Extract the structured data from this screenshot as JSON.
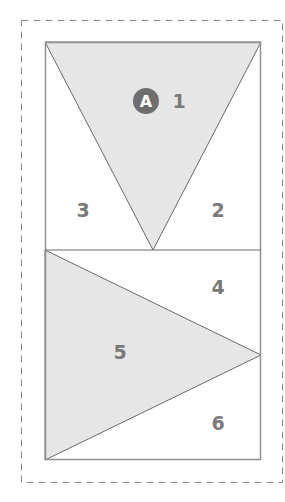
{
  "colors": {
    "fill": "#e6e6e6",
    "stroke": "#6a6a6a",
    "outline": "#909090",
    "dashed": "#8a8a8a",
    "label": "#7a7a7a",
    "badge": "#6e6e6e"
  },
  "badge": {
    "label": "A"
  },
  "pieces": [
    {
      "id": 1,
      "label": "1",
      "shaded": true
    },
    {
      "id": 2,
      "label": "2",
      "shaded": false
    },
    {
      "id": 3,
      "label": "3",
      "shaded": false
    },
    {
      "id": 4,
      "label": "4",
      "shaded": false
    },
    {
      "id": 5,
      "label": "5",
      "shaded": true
    },
    {
      "id": 6,
      "label": "6",
      "shaded": false
    }
  ]
}
